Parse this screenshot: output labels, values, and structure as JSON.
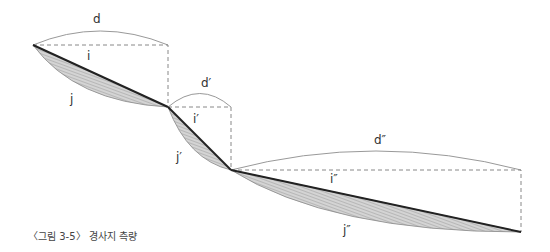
{
  "figure": {
    "caption": "〈그림 3-5〉 경사지 측량",
    "labels": {
      "d": "d",
      "i": "i",
      "j": "j",
      "d1": "d′",
      "i1": "i′",
      "j1": "j′",
      "d2": "d″",
      "i2": "i″",
      "j2": "j″"
    },
    "colors": {
      "slope_line": "#222222",
      "hatch_fill": "#bdbdbd",
      "arc": "#888888",
      "dashed": "#888888"
    }
  }
}
